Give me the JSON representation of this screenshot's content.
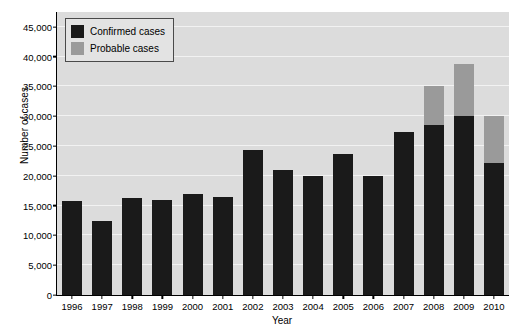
{
  "chart_data": {
    "type": "bar",
    "subtype": "stacked",
    "title": "",
    "xlabel": "Year",
    "ylabel": "Number of cases",
    "categories": [
      "1996",
      "1997",
      "1998",
      "1999",
      "2000",
      "2001",
      "2002",
      "2003",
      "2004",
      "2005",
      "2006",
      "2007",
      "2008",
      "2009",
      "2010"
    ],
    "series": [
      {
        "name": "Confirmed cases",
        "color": "#1a1a1a",
        "values": [
          15800,
          12500,
          16200,
          16000,
          16900,
          16400,
          24300,
          21000,
          19900,
          23700,
          20000,
          27400,
          28500,
          30000,
          22200
        ]
      },
      {
        "name": "Probable cases",
        "color": "#9a9a9a",
        "values": [
          0,
          0,
          0,
          0,
          0,
          0,
          0,
          0,
          0,
          0,
          0,
          0,
          6500,
          8800,
          7800
        ]
      }
    ],
    "totals": [
      15800,
      12500,
      16200,
      16000,
      16900,
      16400,
      24300,
      21000,
      19900,
      23700,
      20000,
      27400,
      35000,
      38800,
      30000
    ],
    "ylim": [
      0,
      47500
    ],
    "yticks": [
      0,
      5000,
      10000,
      15000,
      20000,
      25000,
      30000,
      35000,
      40000,
      45000
    ],
    "ytick_labels": [
      "0",
      "5,000",
      "10,000",
      "15,000",
      "20,000",
      "25,000",
      "30,000",
      "35,000",
      "40,000",
      "45,000"
    ],
    "grid": true,
    "legend_position": "top-left",
    "legend": [
      "Confirmed cases",
      "Probable cases"
    ],
    "plot_background": "#dcdcdc",
    "grid_color": "#f2f2f2"
  }
}
